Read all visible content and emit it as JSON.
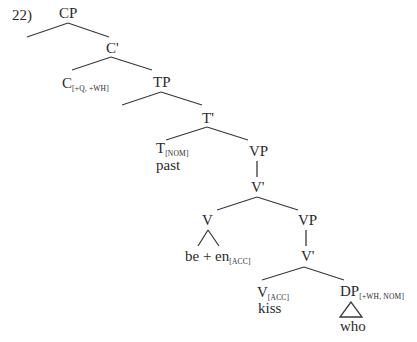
{
  "example_number": "22)",
  "tree": {
    "nodes": {
      "cp": {
        "label": "CP"
      },
      "c_bar": {
        "label": "C'"
      },
      "c_head": {
        "label": "C",
        "features": "[+Q, +WH]"
      },
      "tp": {
        "label": "TP"
      },
      "t_bar": {
        "label": "T'"
      },
      "t_head": {
        "label": "T",
        "features": "[NOM]",
        "word": "past"
      },
      "vp1": {
        "label": "VP"
      },
      "v_bar1": {
        "label": "V'"
      },
      "v_aux": {
        "label": "V",
        "word": "be + en",
        "word_features": "[ACC]"
      },
      "vp2": {
        "label": "VP"
      },
      "v_bar2": {
        "label": "V'"
      },
      "v_head": {
        "label": "V",
        "features": "[ACC]",
        "word": "kiss"
      },
      "dp": {
        "label": "DP",
        "features": "[+WH, NOM]",
        "word": "who"
      }
    }
  }
}
